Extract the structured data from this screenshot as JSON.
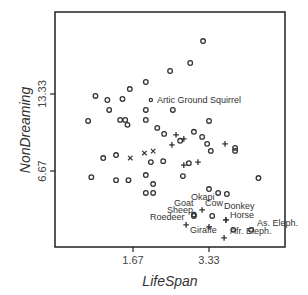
{
  "chart_data": {
    "type": "scatter",
    "title": "",
    "xlabel": "LifeSpan",
    "ylabel": "NonDreaming",
    "x_ticks": [
      "1.67",
      "3.33"
    ],
    "y_ticks": [
      "6.67",
      "13.33"
    ],
    "xlim": [
      -0.65,
      4.35
    ],
    "ylim": [
      -0.85,
      20.3
    ],
    "grid": false,
    "legend": null,
    "marker_legend": {
      "o": "circle",
      "+": "plus",
      "x": "cross"
    },
    "points": [
      {
        "x": 3.2,
        "y": 17.91,
        "m": "o"
      },
      {
        "x": 2.92,
        "y": 16.01,
        "m": "o"
      },
      {
        "x": 2.48,
        "y": 15.32,
        "m": "o"
      },
      {
        "x": 0.85,
        "y": 13.16,
        "m": "o"
      },
      {
        "x": 1.11,
        "y": 12.81,
        "m": "o"
      },
      {
        "x": 1.44,
        "y": 12.9,
        "m": "o"
      },
      {
        "x": 1.6,
        "y": 13.76,
        "m": "o"
      },
      {
        "x": 1.95,
        "y": 14.37,
        "m": "o"
      },
      {
        "x": 0.69,
        "y": 11.0,
        "m": "o"
      },
      {
        "x": 1.15,
        "y": 11.95,
        "m": "o"
      },
      {
        "x": 1.39,
        "y": 11.09,
        "m": "o"
      },
      {
        "x": 1.5,
        "y": 11.09,
        "m": "o"
      },
      {
        "x": 1.55,
        "y": 10.66,
        "m": "o"
      },
      {
        "x": 1.95,
        "y": 11.09,
        "m": "o"
      },
      {
        "x": 1.95,
        "y": 11.95,
        "m": "o"
      },
      {
        "x": 2.06,
        "y": 12.81,
        "m": "dot",
        "label": "Artic Ground Squirrel"
      },
      {
        "x": 2.54,
        "y": 11.95,
        "m": "o"
      },
      {
        "x": 3.33,
        "y": 11.0,
        "m": "o"
      },
      {
        "x": 2.2,
        "y": 10.4,
        "m": "o"
      },
      {
        "x": 2.35,
        "y": 9.88,
        "m": "o"
      },
      {
        "x": 2.7,
        "y": 9.28,
        "m": "o"
      },
      {
        "x": 3.0,
        "y": 10.06,
        "m": "o"
      },
      {
        "x": 3.18,
        "y": 9.62,
        "m": "o"
      },
      {
        "x": 3.29,
        "y": 9.02,
        "m": "o"
      },
      {
        "x": 3.37,
        "y": 8.41,
        "m": "o"
      },
      {
        "x": 2.61,
        "y": 9.8,
        "m": "+"
      },
      {
        "x": 2.78,
        "y": 9.45,
        "m": "+"
      },
      {
        "x": 2.52,
        "y": 8.93,
        "m": "+"
      },
      {
        "x": 3.68,
        "y": 9.02,
        "m": "+"
      },
      {
        "x": 3.9,
        "y": 8.67,
        "m": "o"
      },
      {
        "x": 3.9,
        "y": 8.41,
        "m": "o"
      },
      {
        "x": 1.02,
        "y": 7.79,
        "m": "o"
      },
      {
        "x": 1.3,
        "y": 8.05,
        "m": "o"
      },
      {
        "x": 1.61,
        "y": 7.79,
        "m": "x"
      },
      {
        "x": 1.92,
        "y": 8.22,
        "m": "x"
      },
      {
        "x": 2.11,
        "y": 8.39,
        "m": "x"
      },
      {
        "x": 2.06,
        "y": 7.44,
        "m": "o"
      },
      {
        "x": 2.33,
        "y": 7.52,
        "m": "o"
      },
      {
        "x": 2.78,
        "y": 7.18,
        "m": "+"
      },
      {
        "x": 2.89,
        "y": 7.35,
        "m": "o"
      },
      {
        "x": 3.09,
        "y": 7.44,
        "m": "+"
      },
      {
        "x": 0.76,
        "y": 6.14,
        "m": "o"
      },
      {
        "x": 1.3,
        "y": 5.88,
        "m": "o"
      },
      {
        "x": 1.57,
        "y": 5.88,
        "m": "o"
      },
      {
        "x": 1.95,
        "y": 6.32,
        "m": "o"
      },
      {
        "x": 2.11,
        "y": 5.54,
        "m": "o"
      },
      {
        "x": 1.95,
        "y": 4.77,
        "m": "o"
      },
      {
        "x": 2.11,
        "y": 4.77,
        "m": "o"
      },
      {
        "x": 4.41,
        "y": 6.06,
        "m": "o"
      },
      {
        "x": 2.76,
        "y": 6.23,
        "m": "o"
      },
      {
        "x": 3.33,
        "y": 5.11,
        "m": "o"
      },
      {
        "x": 3.53,
        "y": 4.77,
        "m": "o"
      },
      {
        "x": 3.72,
        "y": 4.68,
        "m": "o"
      },
      {
        "x": 3.18,
        "y": 3.3,
        "m": "+",
        "label": "Okapi"
      },
      {
        "x": 3.0,
        "y": 2.78,
        "m": "o",
        "label": "Sheep"
      },
      {
        "x": 3.0,
        "y": 2.9,
        "m": "o",
        "label": "Goat"
      },
      {
        "x": 3.4,
        "y": 2.78,
        "m": "o",
        "label": "Cow"
      },
      {
        "x": 3.7,
        "y": 2.44,
        "m": "+",
        "label": "Donkey"
      },
      {
        "x": 3.7,
        "y": 2.44,
        "m": "+",
        "label": "Horse"
      },
      {
        "x": 2.83,
        "y": 2.01,
        "m": "+",
        "label": "Roedeer"
      },
      {
        "x": 3.33,
        "y": 1.84,
        "m": "+",
        "label": "Giraffe"
      },
      {
        "x": 3.86,
        "y": 1.58,
        "m": "o"
      },
      {
        "x": 4.25,
        "y": 1.58,
        "m": "o",
        "label": "As. Eleph."
      },
      {
        "x": 3.66,
        "y": 0.89,
        "m": "+",
        "label": "Afr. Eleph."
      }
    ]
  },
  "layout": {
    "frame": {
      "left": 55,
      "top": 12,
      "right": 285,
      "bottom": 247
    },
    "x_tick_px": {
      "1.67": 133,
      "3.33": 209
    },
    "y_tick_px": {
      "13.33": 94,
      "6.67": 171
    }
  },
  "labels": {
    "xlabel": "LifeSpan",
    "ylabel": "NonDreaming",
    "xtick_1": "1.67",
    "xtick_2": "3.33",
    "ytick_1": "13.33",
    "ytick_2": "6.67",
    "squirrel": "Artic Ground Squirrel",
    "okapi": "Okapi",
    "goat": "Goat",
    "cow": "Cow",
    "sheep": "Sheep",
    "donkey": "Donkey",
    "horse": "Horse",
    "roedeer": "Roedeer",
    "giraffe": "Giraffe",
    "as_eleph": "As. Eleph.",
    "afr_eleph": "Afr. Eleph."
  },
  "colors": {
    "marker": "#333333",
    "frame": "#222222",
    "text": "#333333"
  }
}
